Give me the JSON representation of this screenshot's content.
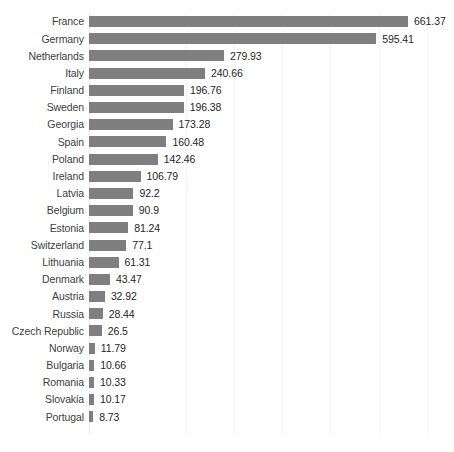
{
  "chart_data": {
    "type": "bar",
    "orientation": "horizontal",
    "title": "",
    "subtitle": "",
    "xlabel": "",
    "ylabel": "",
    "xlim": [
      0,
      715
    ],
    "grid": true,
    "gridlines": [
      200,
      300,
      400,
      500,
      600,
      700
    ],
    "legend": null,
    "legend_position": "none",
    "bar_color": "#7f7f7f",
    "label_color": "#404040",
    "value_color": "#262626",
    "gridline_color": "#f2f2f2",
    "value_format": "decimal",
    "sorted": "descending",
    "categories": [
      "France",
      "Germany",
      "Netherlands",
      "Italy",
      "Finland",
      "Sweden",
      "Georgia",
      "Spain",
      "Poland",
      "Ireland",
      "Latvia",
      "Belgium",
      "Estonia",
      "Switzerland",
      "Lithuania",
      "Denmark",
      "Austria",
      "Russia",
      "Czech Republic",
      "Norway",
      "Bulgaria",
      "Romania",
      "Slovakia",
      "Portugal"
    ],
    "values": [
      661.37,
      595.41,
      279.93,
      240.66,
      196.76,
      196.38,
      173.28,
      160.48,
      142.46,
      106.79,
      92.2,
      90.9,
      81.24,
      77.1,
      61.31,
      43.47,
      32.92,
      28.44,
      26.5,
      11.79,
      10.66,
      10.33,
      10.17,
      8.73
    ],
    "value_labels": [
      "661.37",
      "595.41",
      "279.93",
      "240.66",
      "196.76",
      "196.38",
      "173.28",
      "160.48",
      "142.46",
      "106.79",
      "92.2",
      "90.9",
      "81.24",
      "77.1",
      "61.31",
      "43.47",
      "32.92",
      "28.44",
      "26.5",
      "11.79",
      "10.66",
      "10.33",
      "10.17",
      "8.73"
    ]
  }
}
